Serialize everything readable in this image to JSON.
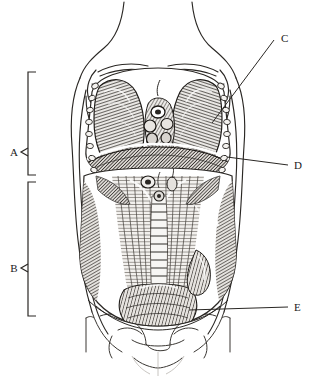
{
  "figure": {
    "view": "anterior",
    "style": "engraving",
    "background_color": "#ffffff",
    "ink_color": "#1a1a1a"
  },
  "labels": [
    {
      "id": "A",
      "text": "A",
      "type": "bracket",
      "x": 14,
      "y": 152,
      "region": "thoracic-cavity",
      "bracket": {
        "x": 28,
        "top": 72,
        "bottom": 175,
        "tick": 8,
        "notch_y": 148
      }
    },
    {
      "id": "B",
      "text": "B",
      "type": "bracket",
      "x": 14,
      "y": 272,
      "region": "abdominal-cavity",
      "bracket": {
        "x": 28,
        "top": 182,
        "bottom": 316,
        "tick": 8,
        "notch_y": 268
      }
    },
    {
      "id": "C",
      "text": "C",
      "type": "leader",
      "x": 281,
      "y": 42,
      "region": "lung-right",
      "leader": {
        "x1": 274,
        "y1": 40,
        "x2": 212,
        "y2": 123
      }
    },
    {
      "id": "D",
      "text": "D",
      "type": "leader",
      "x": 294,
      "y": 169,
      "region": "diaphragm",
      "leader": {
        "x1": 288,
        "y1": 165,
        "x2": 227,
        "y2": 157
      }
    },
    {
      "id": "E",
      "text": "E",
      "type": "leader",
      "x": 294,
      "y": 311,
      "region": "pelvic-brim",
      "leader": {
        "x1": 288,
        "y1": 307,
        "x2": 189,
        "y2": 310
      }
    }
  ],
  "structures": {
    "lungs": "paired-lungs",
    "mediastinum": "heart-and-great-vessels",
    "diaphragm": "diaphragm-dome",
    "omentum": "greater-omentum",
    "intestine": "small-intestine-coils",
    "ribs": "rib-cartilage-markers",
    "clavicle": "clavicle",
    "scapula": "scapula",
    "pelvis": "pelvic-girdle"
  }
}
